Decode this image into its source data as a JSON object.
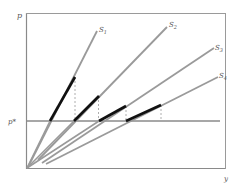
{
  "diagram": {
    "y_axis_label": "p",
    "x_axis_label": "y",
    "price_level_label": "p*",
    "curves": [
      {
        "name": "S",
        "subscript": "1"
      },
      {
        "name": "S",
        "subscript": "2"
      },
      {
        "name": "S",
        "subscript": "3"
      },
      {
        "name": "S",
        "subscript": "4"
      }
    ],
    "colors": {
      "frame": "#8a8a8a",
      "supply_line": "#9a9a9a",
      "highlight_segment": "#111111",
      "dashed": "#999999",
      "label": "#555555"
    }
  }
}
